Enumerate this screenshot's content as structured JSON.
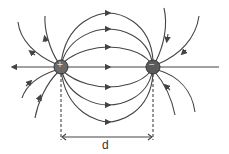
{
  "diagram": {
    "charges": [
      {
        "sign": "+",
        "label": "+",
        "x": 61,
        "y": 67
      },
      {
        "sign": "-",
        "label": "−",
        "x": 153,
        "y": 67
      }
    ],
    "separation_label": "d",
    "colors": {
      "line": "#444444",
      "charge": "#6a6a6a"
    }
  }
}
